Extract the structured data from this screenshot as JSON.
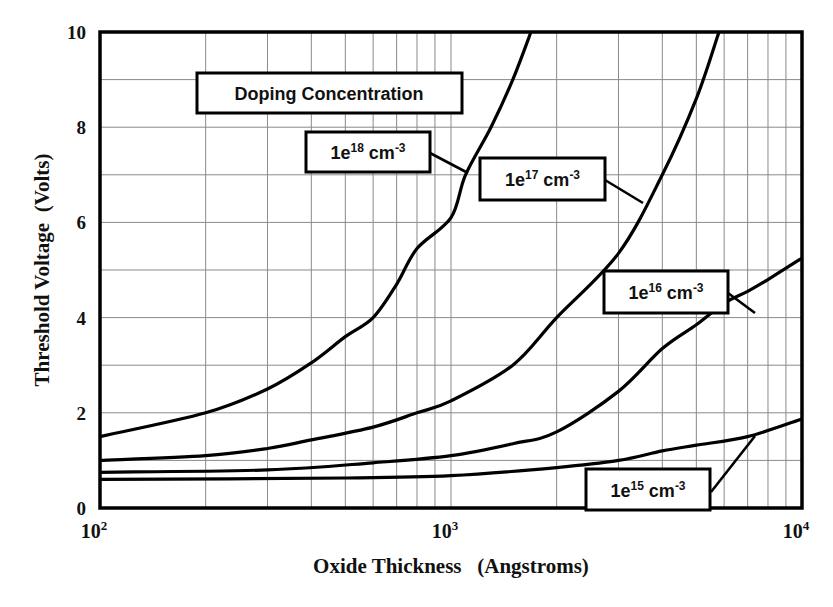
{
  "chart_data": {
    "type": "line",
    "title": "",
    "xlabel": "Oxide Thickness   (Angstroms)",
    "ylabel": "Threshold Voltage  (Volts)",
    "xscale": "log",
    "xlim": [
      100,
      10000
    ],
    "ylim": [
      0,
      10
    ],
    "grid": true,
    "x_ticks": [
      {
        "value": 100,
        "base": "10",
        "exp": "2"
      },
      {
        "value": 1000,
        "base": "10",
        "exp": "3"
      },
      {
        "value": 10000,
        "base": "10",
        "exp": "4"
      }
    ],
    "y_ticks": [
      0,
      2,
      4,
      6,
      8,
      10
    ],
    "y_minor_grid": [
      1,
      3,
      5,
      7,
      9
    ],
    "legend_title": "Doping Concentration",
    "series": [
      {
        "name": "1e18 cm-3",
        "label_base": "1e",
        "label_exp": "18",
        "label_unit": " cm",
        "label_unit_exp": "-3",
        "x": [
          100,
          200,
          300,
          400,
          500,
          600,
          700,
          800,
          1000,
          1100,
          1300,
          1500,
          1690
        ],
        "y": [
          1.5,
          2.0,
          2.5,
          3.05,
          3.6,
          4.0,
          4.7,
          5.45,
          6.1,
          7.0,
          8.0,
          9.0,
          10.0
        ],
        "label_box": {
          "x": 306,
          "y": 132,
          "w": 124,
          "h": 40
        },
        "leader": [
          430,
          153,
          468,
          173
        ]
      },
      {
        "name": "1e17 cm-3",
        "label_base": "1e",
        "label_exp": "17",
        "label_unit": " cm",
        "label_unit_exp": "-3",
        "x": [
          100,
          200,
          300,
          400,
          600,
          800,
          1000,
          1500,
          2000,
          3000,
          4000,
          5000,
          5800
        ],
        "y": [
          1.0,
          1.1,
          1.25,
          1.43,
          1.7,
          2.0,
          2.25,
          3.0,
          4.0,
          5.35,
          7.0,
          8.6,
          10.0
        ],
        "label_box": {
          "x": 480,
          "y": 158,
          "w": 125,
          "h": 42
        },
        "leader": [
          605,
          180,
          643,
          203
        ]
      },
      {
        "name": "1e16 cm-3",
        "label_base": "1e",
        "label_exp": "16",
        "label_unit": " cm",
        "label_unit_exp": "-3",
        "x": [
          100,
          300,
          600,
          1000,
          1500,
          2000,
          3000,
          4000,
          5000,
          6000,
          7000,
          8000,
          10000
        ],
        "y": [
          0.75,
          0.8,
          0.95,
          1.1,
          1.35,
          1.6,
          2.45,
          3.35,
          3.85,
          4.3,
          4.55,
          4.8,
          5.25
        ],
        "label_box": {
          "x": 604,
          "y": 271,
          "w": 124,
          "h": 42
        },
        "leader": [
          728,
          293,
          755,
          313
        ]
      },
      {
        "name": "1e15 cm-3",
        "label_base": "1e",
        "label_exp": "15",
        "label_unit": " cm",
        "label_unit_exp": "-3",
        "x": [
          100,
          500,
          1000,
          2000,
          3000,
          4000,
          5000,
          7000,
          10000
        ],
        "y": [
          0.6,
          0.63,
          0.68,
          0.85,
          1.0,
          1.2,
          1.32,
          1.5,
          1.87
        ],
        "label_box": {
          "x": 586,
          "y": 469,
          "w": 124,
          "h": 41
        },
        "leader": [
          711,
          492,
          755,
          436
        ]
      }
    ]
  }
}
